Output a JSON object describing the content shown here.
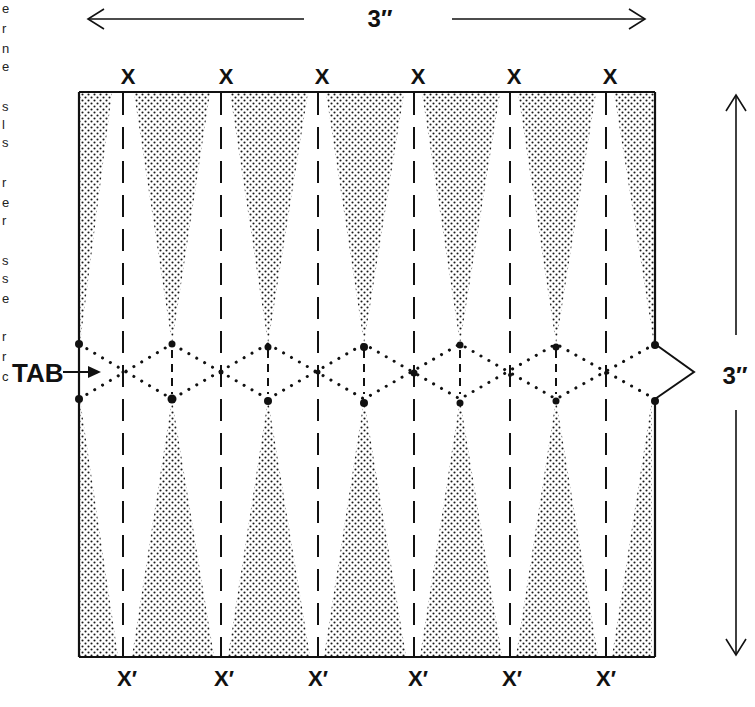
{
  "diagram": {
    "width_dimension": {
      "label": "3″",
      "direction": "horizontal"
    },
    "height_dimension": {
      "label": "3″",
      "direction": "vertical"
    },
    "top_labels": [
      "X",
      "X",
      "X",
      "X",
      "X",
      "X"
    ],
    "bottom_labels": [
      "X′",
      "X′",
      "X′",
      "X′",
      "X′",
      "X′"
    ],
    "tab_label": "TAB",
    "colors": {
      "ink": "#111111",
      "stipple": "#1a1a1a",
      "background": "#ffffff"
    },
    "fold_columns": 6,
    "margin_fragments": [
      "e",
      "r",
      "n",
      "e",
      "",
      "s",
      "l",
      "s",
      "",
      "r",
      "e",
      "r",
      "",
      "s",
      "s",
      "e",
      "r",
      "r",
      "c"
    ]
  }
}
